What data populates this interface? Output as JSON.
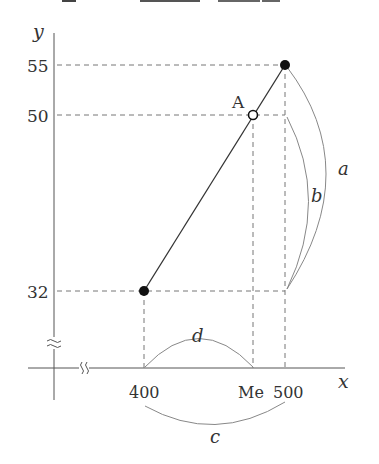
{
  "diagram": {
    "axes": {
      "y_label": "y",
      "x_label": "x",
      "y_break_symbol": "≈",
      "x_break_symbol": "≈"
    },
    "y_ticks": [
      {
        "label": "55"
      },
      {
        "label": "50"
      },
      {
        "label": "32"
      }
    ],
    "x_ticks": [
      {
        "label": "400"
      },
      {
        "label": "Me"
      },
      {
        "label": "500"
      }
    ],
    "points": [
      {
        "label": "",
        "x": 400,
        "y": 32,
        "style": "filled"
      },
      {
        "label": "A",
        "x": "Me",
        "y": 50,
        "style": "hollow"
      },
      {
        "label": "",
        "x": 500,
        "y": 55,
        "style": "filled"
      }
    ],
    "arcs": {
      "a": "a",
      "b": "b",
      "c": "c",
      "d": "d"
    },
    "colors": {
      "line": "#333333",
      "axis": "#555555",
      "dashed": "#777777",
      "arc": "#888888"
    }
  }
}
